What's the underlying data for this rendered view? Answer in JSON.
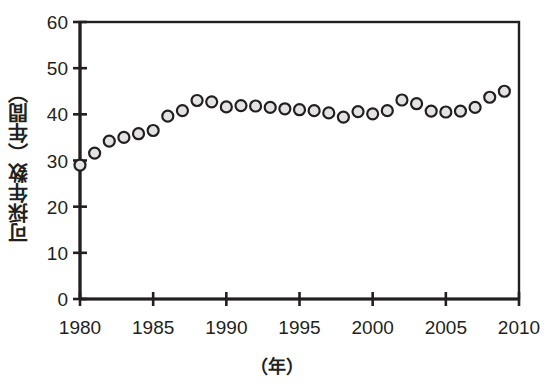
{
  "chart_data": {
    "type": "scatter",
    "title": "",
    "xlabel": "（年）",
    "ylabel": "可採年数（年間）",
    "xlim": [
      1980,
      2010
    ],
    "ylim": [
      0,
      60
    ],
    "xticks": [
      1980,
      1985,
      1990,
      1995,
      2000,
      2005,
      2010
    ],
    "xtick_labels": [
      "1980",
      "1985",
      "1990",
      "1995",
      "2000",
      "2005",
      "2010"
    ],
    "yticks": [
      0,
      10,
      20,
      30,
      40,
      50,
      60
    ],
    "ytick_labels": [
      "0",
      "10",
      "20",
      "30",
      "40",
      "50",
      "60"
    ],
    "grid": false,
    "legend": false,
    "marker": {
      "shape": "circle",
      "fill": "#e3e3e3",
      "edge": "#231f20",
      "size_px": 11,
      "edge_width_px": 2.2
    },
    "x": [
      1980,
      1981,
      1982,
      1983,
      1984,
      1985,
      1986,
      1987,
      1988,
      1989,
      1990,
      1991,
      1992,
      1993,
      1994,
      1995,
      1996,
      1997,
      1998,
      1999,
      2000,
      2001,
      2002,
      2003,
      2004,
      2005,
      2006,
      2007,
      2008,
      2009
    ],
    "values": [
      29.0,
      31.6,
      34.2,
      35.0,
      35.8,
      36.5,
      39.6,
      40.8,
      43.0,
      42.7,
      41.6,
      41.9,
      41.8,
      41.5,
      41.2,
      41.0,
      40.8,
      40.3,
      39.4,
      40.6,
      40.1,
      40.8,
      43.1,
      42.3,
      40.7,
      40.5,
      40.7,
      41.5,
      43.7,
      45.0
    ],
    "series_name": "可採年数"
  },
  "axes": {
    "frame_color": "#231f20"
  }
}
